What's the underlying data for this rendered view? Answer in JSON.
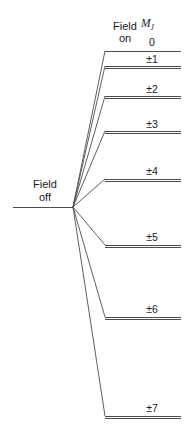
{
  "figure": {
    "name": "zeeman-splitting-diagram",
    "width": 193,
    "height": 438,
    "background": "#ffffff",
    "line_color": "#4d4d4d",
    "text_color": "#1a1a1a"
  },
  "labels": {
    "field_off_line1": "Field",
    "field_off_line2": "off",
    "field_on_line1": "Field",
    "field_on_line2": "on",
    "quantum_symbol": "M",
    "quantum_subscript": "J"
  },
  "chart_data": {
    "type": "diagram",
    "title": "",
    "subtitle": "",
    "xlabel": "",
    "ylabel": "",
    "grid": false,
    "legend": "none",
    "origin": {
      "x": 73,
      "y": 207,
      "label": "field-off-level"
    },
    "field_off_line": {
      "x1": 13,
      "x2": 73,
      "y": 207
    },
    "level_line_x_start": 105,
    "level_line_x_end": 181,
    "categories": [
      "0",
      "±1",
      "±2",
      "±3",
      "±4",
      "±5",
      "±6",
      "±7"
    ],
    "values": [
      0,
      1,
      2,
      3,
      4,
      5,
      6,
      7
    ],
    "levels": [
      {
        "label": "0",
        "mj": 0,
        "y": 51,
        "label_x": 132,
        "label_y": 36,
        "doubled": false
      },
      {
        "label": "±1",
        "mj": 1,
        "y": 66,
        "label_x": 132,
        "label_y": 53,
        "doubled": true
      },
      {
        "label": "±2",
        "mj": 2,
        "y": 96,
        "label_x": 132,
        "label_y": 83,
        "doubled": true
      },
      {
        "label": "±3",
        "mj": 3,
        "y": 131,
        "label_x": 132,
        "label_y": 118,
        "doubled": true
      },
      {
        "label": "±4",
        "mj": 4,
        "y": 179,
        "label_x": 132,
        "label_y": 165,
        "doubled": true
      },
      {
        "label": "±5",
        "mj": 5,
        "y": 245,
        "label_x": 132,
        "label_y": 231,
        "doubled": true
      },
      {
        "label": "±6",
        "mj": 6,
        "y": 317,
        "label_x": 132,
        "label_y": 303,
        "doubled": true
      },
      {
        "label": "±7",
        "mj": 7,
        "y": 416,
        "label_x": 132,
        "label_y": 402,
        "doubled": true
      }
    ],
    "header": {
      "field_on_x": 105,
      "field_on_y": 20,
      "symbol_x": 142,
      "symbol_y": 17
    },
    "field_off_label": {
      "x": 17,
      "y": 178
    }
  }
}
